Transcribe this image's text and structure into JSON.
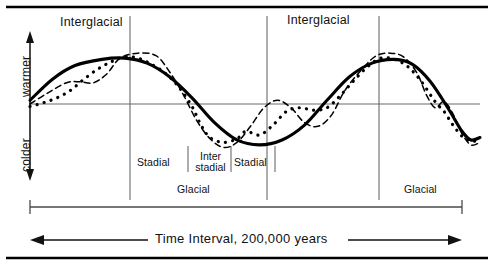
{
  "figure": {
    "kind": "climate-cycle-diagram",
    "width": 494,
    "height": 265,
    "ink_color": "#111111",
    "rule_color": "#000000",
    "grid_color": "#666666"
  },
  "axes": {
    "y_axis": {
      "upper_label": "warmer",
      "lower_label": "colder",
      "arrow": "double-headed-vertical"
    },
    "time_axis": {
      "label": "Time Interval, 200,000 years",
      "arrow_left": "◀",
      "arrow_right": "▶",
      "direction": "bidirectional"
    }
  },
  "bands": {
    "epochs": [
      {
        "label": "Interglacial",
        "x_center": 98
      },
      {
        "label": "Interglacial",
        "x_center": 323
      }
    ],
    "phases": [
      {
        "label": "Glacial",
        "x_center": 198
      },
      {
        "label": "Glacial",
        "x_center": 425
      }
    ],
    "stages": [
      {
        "label": "Stadial",
        "x_center": 158
      },
      {
        "label": "Inter\nstadial",
        "x_center": 209
      },
      {
        "label": "Stadial",
        "x_center": 252
      }
    ]
  },
  "dividers": {
    "tall": [
      130,
      267,
      379
    ],
    "stage_ticks": [
      188,
      231,
      275
    ]
  },
  "interval_bar": {
    "left_tick_x": 30,
    "right_tick_x": 462,
    "mid_ticks": [
      130,
      267,
      379
    ],
    "y": 207
  },
  "chart_data": {
    "type": "line",
    "title": "",
    "xlabel": "Time Interval, 200,000 years",
    "ylabel": "warmer / colder",
    "xlim": [
      0,
      200000
    ],
    "ylim": [
      -1,
      1
    ],
    "grid": false,
    "legend": "none",
    "zero_line": true,
    "series": [
      {
        "name": "long-term trend",
        "style": "solid-thick",
        "description": "smooth two-cycle sinusoid; interglacial peaks, glacial troughs",
        "points": [
          [
            0.0,
            0.06
          ],
          [
            0.05,
            0.4
          ],
          [
            0.1,
            0.62
          ],
          [
            0.16,
            0.72
          ],
          [
            0.21,
            0.74
          ],
          [
            0.26,
            0.66
          ],
          [
            0.31,
            0.44
          ],
          [
            0.36,
            0.1
          ],
          [
            0.41,
            -0.3
          ],
          [
            0.46,
            -0.58
          ],
          [
            0.51,
            -0.66
          ],
          [
            0.56,
            -0.58
          ],
          [
            0.61,
            -0.34
          ],
          [
            0.66,
            0.06
          ],
          [
            0.71,
            0.44
          ],
          [
            0.76,
            0.66
          ],
          [
            0.81,
            0.72
          ],
          [
            0.85,
            0.64
          ],
          [
            0.89,
            0.36
          ],
          [
            0.93,
            -0.08
          ],
          [
            0.96,
            -0.44
          ],
          [
            0.98,
            -0.58
          ],
          [
            1.0,
            -0.54
          ]
        ]
      },
      {
        "name": "intermediate oscillation",
        "style": "dashed",
        "description": "medium-wavelength wiggles superposed on the trend",
        "points": [
          [
            0.0,
            0.0
          ],
          [
            0.04,
            0.18
          ],
          [
            0.08,
            0.34
          ],
          [
            0.11,
            0.36
          ],
          [
            0.14,
            0.34
          ],
          [
            0.17,
            0.48
          ],
          [
            0.2,
            0.74
          ],
          [
            0.24,
            0.82
          ],
          [
            0.28,
            0.78
          ],
          [
            0.31,
            0.52
          ],
          [
            0.34,
            0.16
          ],
          [
            0.37,
            -0.26
          ],
          [
            0.4,
            -0.56
          ],
          [
            0.43,
            -0.7
          ],
          [
            0.46,
            -0.62
          ],
          [
            0.49,
            -0.36
          ],
          [
            0.52,
            -0.06
          ],
          [
            0.55,
            0.06
          ],
          [
            0.58,
            -0.06
          ],
          [
            0.61,
            -0.3
          ],
          [
            0.64,
            -0.36
          ],
          [
            0.67,
            -0.18
          ],
          [
            0.7,
            0.22
          ],
          [
            0.74,
            0.58
          ],
          [
            0.77,
            0.78
          ],
          [
            0.8,
            0.82
          ],
          [
            0.83,
            0.76
          ],
          [
            0.86,
            0.5
          ],
          [
            0.88,
            0.16
          ],
          [
            0.9,
            -0.06
          ],
          [
            0.92,
            0.04
          ],
          [
            0.94,
            -0.16
          ],
          [
            0.96,
            -0.48
          ],
          [
            0.98,
            -0.66
          ],
          [
            1.0,
            -0.62
          ]
        ]
      },
      {
        "name": "short-term fluctuation",
        "style": "dotted",
        "description": "high-frequency dotted record of rapid climate swings",
        "points": [
          [
            0.0,
            -0.04
          ],
          [
            0.03,
            0.02
          ],
          [
            0.06,
            0.1
          ],
          [
            0.09,
            0.22
          ],
          [
            0.12,
            0.4
          ],
          [
            0.15,
            0.56
          ],
          [
            0.18,
            0.68
          ],
          [
            0.21,
            0.76
          ],
          [
            0.24,
            0.74
          ],
          [
            0.27,
            0.64
          ],
          [
            0.3,
            0.5
          ],
          [
            0.33,
            0.28
          ],
          [
            0.36,
            -0.04
          ],
          [
            0.38,
            -0.34
          ],
          [
            0.4,
            -0.54
          ],
          [
            0.43,
            -0.62
          ],
          [
            0.46,
            -0.56
          ],
          [
            0.48,
            -0.44
          ],
          [
            0.51,
            -0.5
          ],
          [
            0.54,
            -0.34
          ],
          [
            0.57,
            -0.12
          ],
          [
            0.6,
            -0.06
          ],
          [
            0.63,
            -0.1
          ],
          [
            0.66,
            -0.06
          ],
          [
            0.69,
            0.14
          ],
          [
            0.72,
            0.38
          ],
          [
            0.75,
            0.6
          ],
          [
            0.78,
            0.74
          ],
          [
            0.81,
            0.72
          ],
          [
            0.84,
            0.6
          ],
          [
            0.87,
            0.36
          ],
          [
            0.9,
            0.04
          ],
          [
            0.92,
            -0.12
          ],
          [
            0.94,
            -0.34
          ],
          [
            0.96,
            -0.52
          ],
          [
            0.98,
            -0.6
          ],
          [
            1.0,
            -0.58
          ]
        ]
      }
    ],
    "annotations": [
      "Interglacial",
      "Glacial",
      "Stadial",
      "Interstadial",
      "Stadial",
      "Interglacial",
      "Glacial",
      "warmer",
      "colder",
      "Time Interval, 200,000 years"
    ]
  }
}
